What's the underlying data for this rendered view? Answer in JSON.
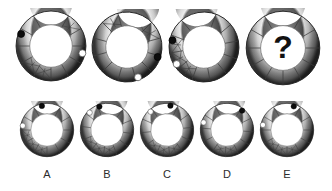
{
  "puzzle": {
    "type": "visual-analogy-ring-puzzle",
    "background_color": "#ffffff",
    "ring_colors": {
      "outer_edge": "#3a3a3a",
      "band_light": "#e8e8e8",
      "band_mid": "#9a9a9a",
      "band_dark": "#4f4f4f",
      "inner_hole": "#ffffff",
      "divider": "#3d3d3d",
      "marker_black": "#0d0d0d",
      "marker_white": "#ffffff",
      "label_text": "#2b2b2b"
    },
    "question_mark": "?"
  },
  "sequence": {
    "name": "top-row-sequence",
    "count": 4,
    "items": [
      {
        "id": "seq-1",
        "position": 1,
        "segments": 12,
        "rotation_deg": 0,
        "markers": [
          {
            "kind": "black-dot",
            "angle_deg": -68,
            "radius_frac": 0.8
          },
          {
            "kind": "white-dot",
            "angle_deg": 103,
            "radius_frac": 0.8
          }
        ],
        "hatch_segments": [
          1,
          6,
          7
        ],
        "is_question": false
      },
      {
        "id": "seq-2",
        "position": 2,
        "segments": 12,
        "rotation_deg": 15,
        "markers": [
          {
            "kind": "white-dot",
            "angle_deg": 160,
            "radius_frac": 0.8
          },
          {
            "kind": "black-dot",
            "angle_deg": 108,
            "radius_frac": 0.8
          }
        ],
        "hatch_segments": [
          0,
          1,
          10
        ],
        "is_question": false
      },
      {
        "id": "seq-3",
        "position": 3,
        "segments": 12,
        "rotation_deg": -10,
        "markers": [
          {
            "kind": "black-dot",
            "angle_deg": -78,
            "radius_frac": 0.8
          },
          {
            "kind": "white-dot",
            "angle_deg": -122,
            "radius_frac": 0.8
          }
        ],
        "hatch_segments": [
          7,
          8,
          9
        ],
        "is_question": false
      },
      {
        "id": "seq-4",
        "position": 4,
        "segments": 12,
        "rotation_deg": 0,
        "markers": [],
        "hatch_segments": [],
        "is_question": true
      }
    ]
  },
  "options": {
    "name": "answer-options-row",
    "count": 5,
    "items": [
      {
        "id": "option-a",
        "label": "A",
        "segments": 12,
        "rotation_deg": 0,
        "markers": [
          {
            "kind": "white-dot",
            "angle_deg": -80,
            "radius_frac": 0.8
          },
          {
            "kind": "black-dot",
            "angle_deg": -12,
            "radius_frac": 0.8
          }
        ],
        "hatch_segments": [
          6,
          7,
          8
        ]
      },
      {
        "id": "option-b",
        "label": "B",
        "segments": 12,
        "rotation_deg": 8,
        "markers": [
          {
            "kind": "white-dot",
            "angle_deg": -45,
            "radius_frac": 0.8
          },
          {
            "kind": "black-dot",
            "angle_deg": -18,
            "radius_frac": 0.8
          }
        ],
        "hatch_segments": [
          5,
          6,
          7
        ]
      },
      {
        "id": "option-c",
        "label": "C",
        "segments": 12,
        "rotation_deg": -6,
        "markers": [
          {
            "kind": "white-dot",
            "angle_deg": -42,
            "radius_frac": 0.8
          },
          {
            "kind": "black-dot",
            "angle_deg": 8,
            "radius_frac": 0.8
          }
        ],
        "hatch_segments": [
          5,
          6,
          7
        ]
      },
      {
        "id": "option-d",
        "label": "D",
        "segments": 12,
        "rotation_deg": 4,
        "markers": [
          {
            "kind": "white-dot",
            "angle_deg": -72,
            "radius_frac": 0.8
          },
          {
            "kind": "black-dot",
            "angle_deg": 38,
            "radius_frac": 0.8
          }
        ],
        "hatch_segments": [
          5,
          6
        ]
      },
      {
        "id": "option-e",
        "label": "E",
        "segments": 12,
        "rotation_deg": 0,
        "markers": [
          {
            "kind": "white-dot",
            "angle_deg": -78,
            "radius_frac": 0.8
          },
          {
            "kind": "black-dot",
            "angle_deg": 16,
            "radius_frac": 0.8
          }
        ],
        "hatch_segments": [
          5,
          6,
          7
        ]
      }
    ]
  },
  "layout": {
    "top_row": [
      {
        "x": 13,
        "y": 8,
        "size": 76
      },
      {
        "x": 89,
        "y": 9,
        "size": 76
      },
      {
        "x": 166,
        "y": 9,
        "size": 76
      },
      {
        "x": 243,
        "y": 8,
        "size": 80
      }
    ],
    "bottom_row": [
      {
        "x": 18,
        "y": 101,
        "size": 58
      },
      {
        "x": 78,
        "y": 101,
        "size": 58
      },
      {
        "x": 138,
        "y": 101,
        "size": 58
      },
      {
        "x": 198,
        "y": 101,
        "size": 58
      },
      {
        "x": 258,
        "y": 101,
        "size": 58
      }
    ],
    "label_y": 168
  }
}
